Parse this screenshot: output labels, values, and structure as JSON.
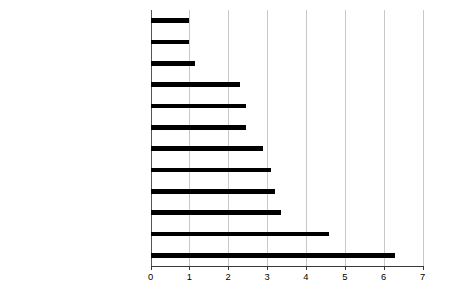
{
  "chart_data": {
    "type": "bar",
    "orientation": "horizontal",
    "title": "",
    "subtitle": "",
    "xlabel": "",
    "ylabel": "",
    "xlim": [
      0,
      7
    ],
    "ylim": null,
    "grid": true,
    "legend": null,
    "xticks": [
      "0",
      "1",
      "2",
      "3",
      "4",
      "5",
      "6",
      "7"
    ],
    "xtick_values": [
      0,
      1,
      2,
      3,
      4,
      5,
      6,
      7
    ],
    "categories": [
      "Mathematics/Computer science",
      "Social science",
      "Materials science",
      "Biological sciences",
      "Environmental sciences",
      "Earth sciences",
      "Chemistry",
      "Physics",
      "Pharmacology",
      "Clinical Medicine",
      "Neurosciences",
      "Life sciences"
    ],
    "values": [
      1.0,
      1.0,
      1.15,
      2.3,
      2.45,
      2.45,
      2.9,
      3.1,
      3.2,
      3.35,
      4.6,
      6.3
    ],
    "bar_color": "#000000",
    "grid_color": "#c8c8c8",
    "axis_color": "#3a3a3a"
  }
}
